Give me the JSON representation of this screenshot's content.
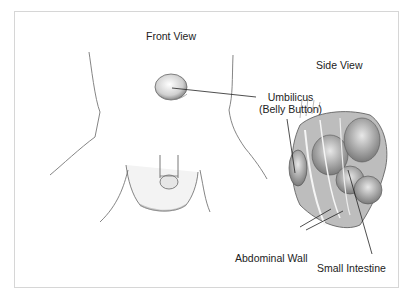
{
  "diagram": {
    "views": {
      "front": {
        "title": "Front View"
      },
      "side": {
        "title": "Side View"
      }
    },
    "labels": {
      "umbilicus": {
        "line1": "Umbilicus",
        "line2": "(Belly Button)"
      },
      "abdominal_wall": "Abdominal Wall",
      "small_intestine": "Small Intestine"
    },
    "colors": {
      "frame_border": "#d6d6d6",
      "ink": "#222222",
      "shade": "#9a9a9a"
    }
  }
}
